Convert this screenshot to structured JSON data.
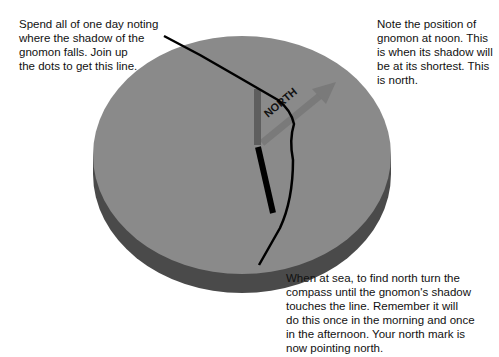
{
  "annotations": {
    "shadow_line_note": "Spend all of one day noting\nwhere the shadow of the\ngnomon falls. Join up\nthe dots to get this line.",
    "noon_note": "Note the position of\ngnomon at noon. This\nis when its shadow will\nbe at its shortest. This\nis north.",
    "at_sea_note": "When at sea, to find north turn the\ncompass until the gnomon's shadow\ntouches the line. Remember it will\ndo this once in the morning and once\nin the afternoon. Your north mark is\nnow pointing north."
  },
  "north_arrow": {
    "label": "NORTH"
  },
  "colors": {
    "disc_top": "#8a8a8a",
    "disc_side": "#4a4a4a",
    "north_arrow": "#7a7a7a",
    "gnomon": "#5e5e5e",
    "shadow": "#000000",
    "shadow_curve": "#000000",
    "text": "#111111",
    "background": "#ffffff"
  }
}
